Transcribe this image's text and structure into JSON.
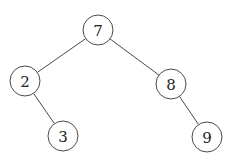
{
  "diagram": {
    "type": "binary-tree",
    "colors": {
      "stroke": "#4a4a4a",
      "text": "#222222",
      "fill": "#ffffff"
    },
    "radius": 15,
    "nodes": [
      {
        "id": "n7",
        "label": "7",
        "x": 98,
        "y": 30
      },
      {
        "id": "n2",
        "label": "2",
        "x": 25,
        "y": 81
      },
      {
        "id": "n8",
        "label": "8",
        "x": 171,
        "y": 84
      },
      {
        "id": "n3",
        "label": "3",
        "x": 63,
        "y": 136
      },
      {
        "id": "n9",
        "label": "9",
        "x": 207,
        "y": 137
      }
    ],
    "edges": [
      {
        "from": "n7",
        "to": "n2"
      },
      {
        "from": "n7",
        "to": "n8"
      },
      {
        "from": "n2",
        "to": "n3"
      },
      {
        "from": "n8",
        "to": "n9"
      }
    ]
  }
}
